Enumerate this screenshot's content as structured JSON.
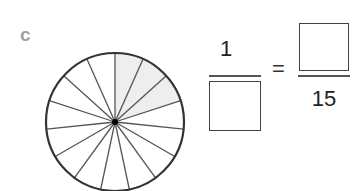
{
  "problem_label": "c",
  "circle": {
    "total_sectors": 15,
    "shaded_sectors": 3,
    "shade_color": "#eeeeee",
    "stroke_color": "#333333"
  },
  "equation": {
    "left_fraction": {
      "numerator": "1",
      "denominator": ""
    },
    "equals": "=",
    "right_fraction": {
      "numerator": "",
      "denominator": "15"
    }
  }
}
